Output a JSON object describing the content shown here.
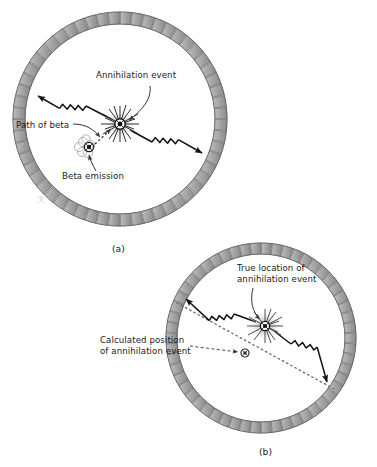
{
  "figure": {
    "panels": [
      {
        "id": "a",
        "caption": "(a)",
        "caption_x": 115,
        "caption_y": 249,
        "ring": {
          "cx": 120,
          "cy": 119,
          "r_outer": 107,
          "r_inner": 95,
          "segments": 56
        },
        "labels": [
          {
            "name": "annihilation-event",
            "text": "Annihilation event",
            "x": 96,
            "y": 77,
            "align": "left"
          },
          {
            "name": "path-of-beta",
            "text": "Path of beta",
            "x": 16,
            "y": 126,
            "align": "left"
          },
          {
            "name": "beta-emission",
            "text": "Beta emission",
            "x": 62,
            "y": 177,
            "align": "left"
          }
        ],
        "annihilation_point": {
          "x": 120,
          "y": 124
        },
        "beta_point": {
          "x": 88,
          "y": 147
        },
        "gamma_rays": [
          {
            "name": "gamma-ray-upper-left",
            "from_x": 120,
            "from_y": 124,
            "to_x": 36,
            "to_y": 79
          },
          {
            "name": "gamma-ray-lower-right",
            "from_x": 120,
            "from_y": 124,
            "to_x": 206,
            "to_y": 170
          }
        ]
      },
      {
        "id": "b",
        "caption": "(b)",
        "caption_x": 262,
        "caption_y": 452,
        "ring": {
          "cx": 261,
          "cy": 338,
          "r_outer": 95,
          "r_inner": 84,
          "segments": 54
        },
        "labels": [
          {
            "name": "true-location",
            "text": "True location of\nannihilation event",
            "x": 237,
            "y": 269,
            "align": "left"
          },
          {
            "name": "calculated-position",
            "text": "Calculated position\nof annihilation event",
            "x": 108,
            "y": 341,
            "align": "left"
          }
        ],
        "true_location_point": {
          "x": 265,
          "y": 326
        },
        "calculated_position_point": {
          "x": 245,
          "y": 353
        },
        "gamma_rays": [
          {
            "name": "gamma-ray-upper-left",
            "from_x": 265,
            "from_y": 326,
            "to_x": 177,
            "to_y": 298
          },
          {
            "name": "gamma-ray-lower-right",
            "from_x": 265,
            "from_y": 326,
            "to_x": 330,
            "to_y": 386
          }
        ],
        "line_of_response": {
          "name": "dotted-line-of-response",
          "x1": 177,
          "y1": 303,
          "x2": 336,
          "y2": 390
        }
      }
    ],
    "colors": {
      "detector_fill": "#a3a3a3",
      "detector_stroke": "#555555",
      "ring_wall": "#8f8f8f",
      "line": "#111111",
      "text": "#1a1a1a",
      "burst_glow": "#c9c9c9",
      "background": "#ffffff"
    }
  }
}
